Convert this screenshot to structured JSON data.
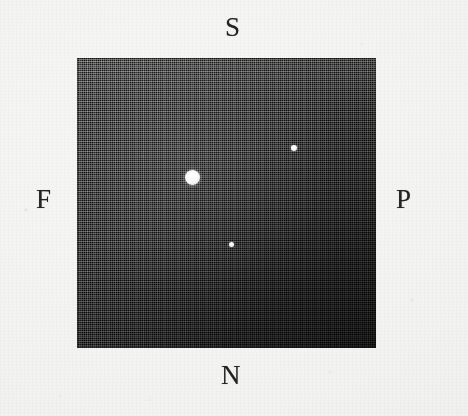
{
  "figure": {
    "kind": "astronomical-plate-reproduction",
    "background_color": "#f4f4f2",
    "plate_color": "#0a0a0a",
    "star_color": "#ffffff",
    "label_color": "#232323",
    "orientation_labels": {
      "top": "S",
      "bottom": "N",
      "left": "F",
      "right": "P"
    }
  },
  "chart_data": {
    "type": "scatter",
    "title": "",
    "xlabel": "",
    "ylabel": "",
    "grid": false,
    "legend": null,
    "axis_orientation_labels": {
      "top": "S",
      "bottom": "N",
      "left": "F",
      "right": "P"
    },
    "plate_bounds_px": {
      "x": 77,
      "y": 58,
      "width": 299,
      "height": 290
    },
    "xlim": [
      0,
      299
    ],
    "ylim": [
      0,
      290
    ],
    "points": [
      {
        "name": "primary-star",
        "x": 115,
        "y": 119,
        "diameter_px": 15,
        "brightness": "bright"
      },
      {
        "name": "secondary-star",
        "x": 217,
        "y": 90,
        "diameter_px": 6,
        "brightness": "faint"
      },
      {
        "name": "tertiary-star",
        "x": 154,
        "y": 186,
        "diameter_px": 5,
        "brightness": "faint"
      }
    ]
  }
}
